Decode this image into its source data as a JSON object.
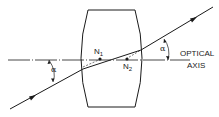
{
  "diagram": {
    "title": "",
    "nodal_points": [
      {
        "name": "N",
        "subscript": "1"
      },
      {
        "name": "N",
        "subscript": "2"
      }
    ],
    "angle_label_left": "α",
    "angle_label_right": "α",
    "axis_label_line1": "OPTICAL",
    "axis_label_line2": "AXIS",
    "colors": {
      "line": "#1a1a1a",
      "background": "#ffffff"
    }
  }
}
